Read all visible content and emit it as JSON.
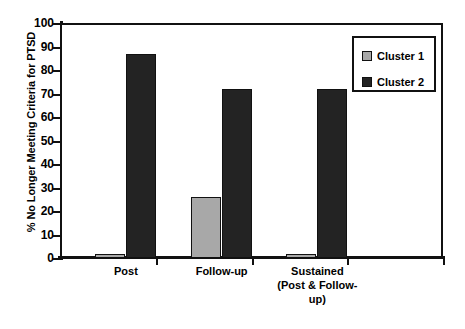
{
  "chart_data": {
    "type": "bar",
    "title": "",
    "xlabel": "",
    "ylabel": "% No Longer Meeting Criteria for PTSD",
    "ylim": [
      0,
      100
    ],
    "yticks": [
      0,
      10,
      20,
      30,
      40,
      50,
      60,
      70,
      80,
      90,
      100
    ],
    "ytick_labels": [
      "0",
      "10",
      "20",
      "30",
      "40",
      "50",
      "60",
      "70",
      "80",
      "90",
      "100"
    ],
    "grid": false,
    "legend_position": "top-right",
    "categories": [
      "Post",
      "Follow-up",
      "Sustained (Post & Follow-up)"
    ],
    "category_lines": [
      [
        "Post"
      ],
      [
        "Follow-up"
      ],
      [
        "Sustained",
        "(Post & Follow-",
        "up)"
      ]
    ],
    "series": [
      {
        "name": "Cluster 1",
        "color": "#a8a8a8",
        "values": [
          1.5,
          26,
          1.5
        ]
      },
      {
        "name": "Cluster 2",
        "color": "#232323",
        "values": [
          87,
          72,
          72
        ]
      }
    ]
  },
  "legend": {
    "items": [
      {
        "label": "Cluster 1",
        "swatch": "cluster-1-swatch"
      },
      {
        "label": "Cluster 2",
        "swatch": "cluster-2-swatch"
      }
    ]
  }
}
